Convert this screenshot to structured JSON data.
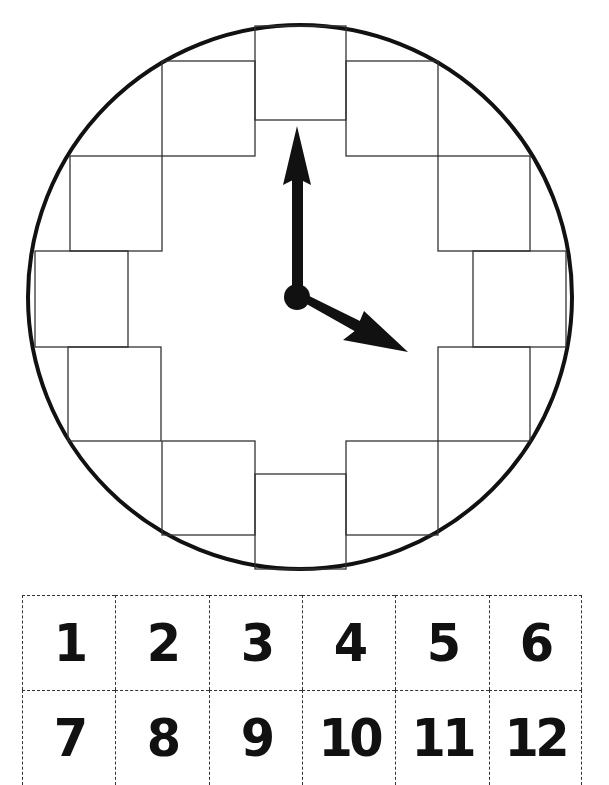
{
  "worksheet": {
    "title": "Clock puzzle: cut out numbers and place them on the clock face",
    "clock": {
      "time_shown": "4:00",
      "hour_hand_points_to": 4,
      "minute_hand_points_to": 12,
      "hand_color": "#111111",
      "outline_color": "#111111",
      "slots": [
        {
          "position": 12,
          "label": ""
        },
        {
          "position": 1,
          "label": ""
        },
        {
          "position": 2,
          "label": ""
        },
        {
          "position": 3,
          "label": ""
        },
        {
          "position": 4,
          "label": ""
        },
        {
          "position": 5,
          "label": ""
        },
        {
          "position": 6,
          "label": ""
        },
        {
          "position": 7,
          "label": ""
        },
        {
          "position": 8,
          "label": ""
        },
        {
          "position": 9,
          "label": ""
        },
        {
          "position": 10,
          "label": ""
        },
        {
          "position": 11,
          "label": ""
        }
      ]
    },
    "number_tiles": [
      "1",
      "2",
      "3",
      "4",
      "5",
      "6",
      "7",
      "8",
      "9",
      "10",
      "11",
      "12"
    ]
  }
}
